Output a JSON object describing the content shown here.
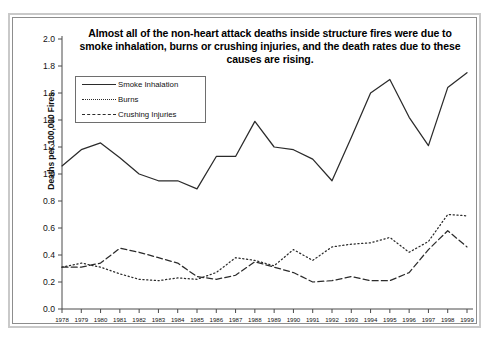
{
  "chart_data": {
    "type": "line",
    "title": "Almost all of the non-heart attack deaths inside structure fires were due to smoke inhalation, burns or crushing injuries, and the death rates due to these causes are rising.",
    "xlabel": "",
    "ylabel": "Deaths per 100,000 Fires",
    "ylim": [
      0.0,
      2.0
    ],
    "ytick_labels": [
      "0.0",
      "0.2",
      "0.4",
      "0.6",
      "0.8",
      "1.0",
      "1.2",
      "1.4",
      "1.6",
      "1.8",
      "2.0"
    ],
    "ytick_values": [
      0.0,
      0.2,
      0.4,
      0.6,
      0.8,
      1.0,
      1.2,
      1.4,
      1.6,
      1.8,
      2.0
    ],
    "grid": false,
    "legend_position": "upper-left",
    "categories": [
      "1978",
      "1979",
      "1980",
      "1981",
      "1982",
      "1983",
      "1984",
      "1985",
      "1986",
      "1987",
      "1988",
      "1989",
      "1990",
      "1991",
      "1992",
      "1993",
      "1994",
      "1995",
      "1996",
      "1997",
      "1998",
      "1999"
    ],
    "series": [
      {
        "name": "Smoke Inhalation",
        "style": "solid",
        "color": "#2b2b2b",
        "values": [
          1.06,
          1.18,
          1.23,
          1.12,
          1.0,
          0.95,
          0.95,
          0.89,
          1.13,
          1.13,
          1.39,
          1.2,
          1.18,
          1.11,
          0.95,
          1.27,
          1.6,
          1.7,
          1.42,
          1.21,
          1.64,
          1.75
        ]
      },
      {
        "name": "Burns",
        "style": "dotted",
        "color": "#2b2b2b",
        "values": [
          0.31,
          0.34,
          0.31,
          0.26,
          0.22,
          0.21,
          0.23,
          0.22,
          0.27,
          0.38,
          0.36,
          0.32,
          0.44,
          0.36,
          0.46,
          0.48,
          0.49,
          0.53,
          0.42,
          0.5,
          0.7,
          0.69
        ]
      },
      {
        "name": "Crushing Injuries",
        "style": "dashed",
        "color": "#2b2b2b",
        "values": [
          0.31,
          0.31,
          0.34,
          0.45,
          0.42,
          0.38,
          0.34,
          0.24,
          0.22,
          0.25,
          0.35,
          0.31,
          0.27,
          0.2,
          0.21,
          0.24,
          0.21,
          0.21,
          0.27,
          0.44,
          0.58,
          0.46
        ]
      }
    ],
    "legend_entries": [
      "Smoke Inhalation",
      "Burns",
      "Crushing Injuries"
    ]
  }
}
